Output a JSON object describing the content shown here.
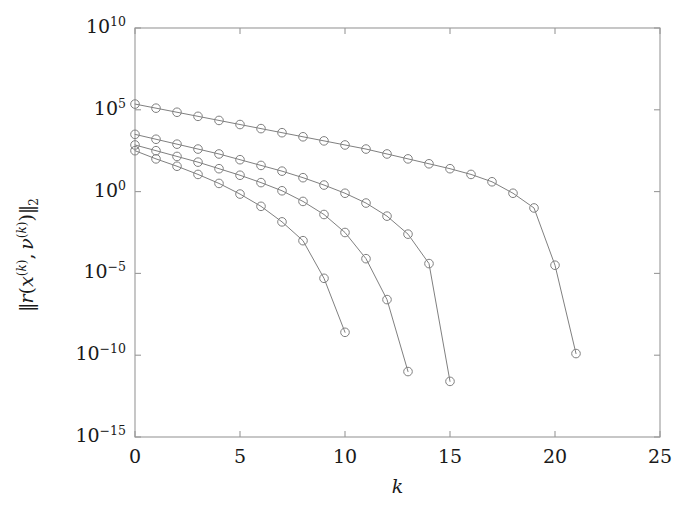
{
  "chart_data": {
    "type": "line",
    "title": "",
    "xlabel": "k",
    "ylabel": "||r(x^(k), v^(k))||_2",
    "ylabel_parts": {
      "norm_open": "‖",
      "r": "r",
      "paren_open": "(",
      "x": "x",
      "x_sup": "(k)",
      "comma": ",",
      "nu": "ν",
      "nu_sup": "(k)",
      "paren_close": ")",
      "norm_close": "‖",
      "norm_sub": "2"
    },
    "xlim": [
      0,
      25
    ],
    "ylim_log10": [
      -15,
      10
    ],
    "yscale": "log",
    "xscale": "linear",
    "xticks": [
      0,
      5,
      10,
      15,
      20,
      25
    ],
    "xtick_labels": [
      "0",
      "5",
      "10",
      "15",
      "20",
      "25"
    ],
    "yticks_log10": [
      10,
      5,
      0,
      -5,
      -10,
      -15
    ],
    "ytick_labels": [
      "10",
      "10",
      "10",
      "10",
      "10",
      "10"
    ],
    "ytick_exponents": [
      "10",
      "5",
      "0",
      "−5",
      "−10",
      "−15"
    ],
    "grid": false,
    "legend": null,
    "marker": "circle-open",
    "line_color": "#808080",
    "marker_color": "#808080",
    "axis_color": "#999999",
    "text_color": "#1a1a1a",
    "background": "#ffffff",
    "series": [
      {
        "name": "curve-1",
        "x": [
          0,
          1,
          2,
          3,
          4,
          5,
          6,
          7,
          8,
          9,
          10
        ],
        "y_log10": [
          2.5,
          2.0,
          1.55,
          1.05,
          0.5,
          -0.15,
          -0.9,
          -1.85,
          -3.0,
          -5.3,
          -8.6
        ]
      },
      {
        "name": "curve-2",
        "x": [
          0,
          1,
          2,
          3,
          4,
          5,
          6,
          7,
          8,
          9,
          10,
          11,
          12,
          13
        ],
        "y_log10": [
          2.85,
          2.5,
          2.15,
          1.8,
          1.4,
          1.0,
          0.55,
          0.05,
          -0.6,
          -1.4,
          -2.5,
          -4.1,
          -6.6,
          -11.0
        ]
      },
      {
        "name": "curve-3",
        "x": [
          0,
          1,
          2,
          3,
          4,
          5,
          6,
          7,
          8,
          9,
          10,
          11,
          12,
          13,
          14,
          15
        ],
        "y_log10": [
          3.5,
          3.2,
          2.9,
          2.6,
          2.3,
          1.95,
          1.6,
          1.25,
          0.85,
          0.4,
          -0.1,
          -0.7,
          -1.5,
          -2.6,
          -4.4,
          -11.6
        ]
      },
      {
        "name": "curve-4",
        "x": [
          0,
          1,
          2,
          3,
          4,
          5,
          6,
          7,
          8,
          9,
          10,
          11,
          12,
          13,
          14,
          15,
          16,
          17,
          18,
          19,
          20,
          21
        ],
        "y_log10": [
          5.35,
          5.1,
          4.85,
          4.6,
          4.35,
          4.1,
          3.85,
          3.6,
          3.35,
          3.1,
          2.85,
          2.6,
          2.3,
          2.0,
          1.7,
          1.4,
          1.05,
          0.6,
          -0.1,
          -1.0,
          -4.5,
          -9.9
        ]
      }
    ]
  },
  "axes": {
    "plot_box": {
      "left": 135,
      "top": 28,
      "right": 660,
      "bottom": 437
    }
  }
}
